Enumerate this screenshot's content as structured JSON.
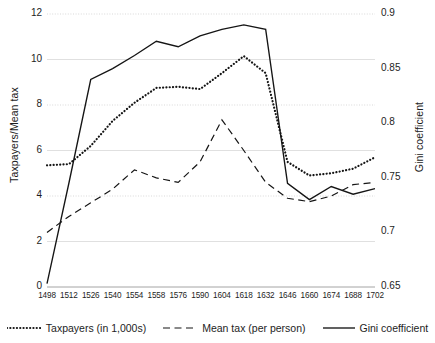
{
  "chart_data": {
    "type": "line",
    "title": "",
    "xlabel": "",
    "ylabel": "Taxpayers/Mean tax",
    "y2label": "Gini coefficient",
    "grid": true,
    "legend_position": "bottom",
    "categories": [
      "1498",
      "1512",
      "1526",
      "1540",
      "1554",
      "1558",
      "1576",
      "1590",
      "1604",
      "1618",
      "1632",
      "1646",
      "1660",
      "1674",
      "1688",
      "1702"
    ],
    "x_tick_labels": [
      "1498",
      "1512",
      "1526",
      "1540",
      "1554",
      "1558",
      "1576",
      "1590",
      "1604",
      "1618",
      "1632",
      "1646",
      "1660",
      "1674",
      "1688",
      "1702"
    ],
    "ylim": [
      0,
      12
    ],
    "y_ticks": [
      "0",
      "2",
      "4",
      "6",
      "8",
      "10",
      "12"
    ],
    "y2lim": [
      0.65,
      0.9
    ],
    "y2_ticks": [
      "0.65",
      "0.7",
      "0.75",
      "0.8",
      "0.85",
      "0.9"
    ],
    "series": [
      {
        "name": "Taxpayers (in 1,000s)",
        "axis": "left",
        "style": "dotted",
        "values": [
          5.35,
          5.4,
          6.2,
          7.3,
          8.1,
          8.75,
          8.8,
          8.7,
          9.4,
          10.15,
          9.4,
          5.5,
          4.9,
          5.0,
          5.2,
          5.7
        ]
      },
      {
        "name": "Mean tax (per person)",
        "axis": "left",
        "style": "dashed",
        "values": [
          2.4,
          3.1,
          3.7,
          4.3,
          5.15,
          4.8,
          4.6,
          5.5,
          7.35,
          6.0,
          4.6,
          3.9,
          3.75,
          4.0,
          4.5,
          4.6
        ]
      },
      {
        "name": "Gini coefficient",
        "axis": "right",
        "style": "solid",
        "values": [
          0.653,
          0.745,
          0.84,
          0.85,
          0.862,
          0.875,
          0.87,
          0.88,
          0.886,
          0.89,
          0.886,
          0.745,
          0.73,
          0.742,
          0.735,
          0.74
        ]
      }
    ]
  },
  "legend": {
    "items": [
      {
        "label": "Taxpayers (in 1,000s)",
        "style": "dotted"
      },
      {
        "label": "Mean tax (per person)",
        "style": "dashed"
      },
      {
        "label": "Gini coefficient",
        "style": "solid"
      }
    ]
  }
}
